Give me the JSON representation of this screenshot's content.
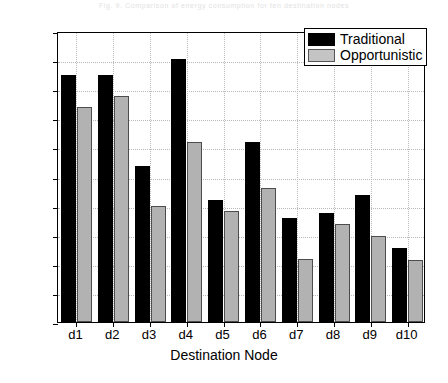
{
  "caption": {
    "text": "Fig. 9. Comparison of energy consumption for ten destination nodes"
  },
  "chart_data": {
    "type": "bar",
    "title": "",
    "xlabel": "Destination Node",
    "ylabel": "Energy (Joule)",
    "categories": [
      "d1",
      "d2",
      "d3",
      "d4",
      "d5",
      "d6",
      "d7",
      "d8",
      "d9",
      "d10"
    ],
    "series": [
      {
        "name": "Traditional",
        "color": "#000000",
        "values": [
          4.25,
          4.25,
          2.68,
          4.52,
          2.1,
          3.1,
          1.78,
          1.88,
          2.18,
          1.28
        ]
      },
      {
        "name": "Opportunistic",
        "color": "#b2b2b2",
        "values": [
          3.7,
          3.88,
          2.0,
          3.1,
          1.9,
          2.3,
          1.08,
          1.68,
          1.48,
          1.07
        ]
      }
    ],
    "ylim": [
      0,
      5
    ],
    "yticks": [
      0,
      0.5,
      1,
      1.5,
      2,
      2.5,
      3,
      3.5,
      4,
      4.5,
      5
    ],
    "yticklabels": [
      "0",
      "0.5",
      "1",
      "1.5",
      "2",
      "2.5",
      "3",
      "3.5",
      "4",
      "4.5",
      "5"
    ],
    "grid": true,
    "grid_color": "#b9b9b9",
    "legend_position": "top-right",
    "frame_color": "#000000",
    "background": "#ffffff"
  }
}
